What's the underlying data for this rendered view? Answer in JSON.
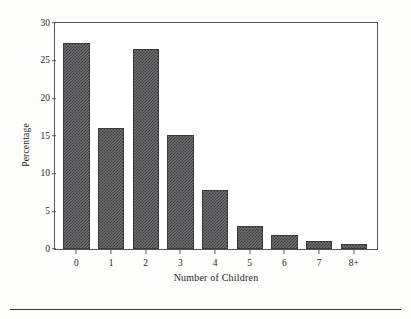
{
  "chart_data": {
    "type": "bar",
    "title": "",
    "xlabel": "Number of Children",
    "ylabel": "Percentage",
    "categories": [
      "0",
      "1",
      "2",
      "3",
      "4",
      "5",
      "6",
      "7",
      "8+"
    ],
    "values": [
      27.4,
      16.0,
      26.6,
      15.2,
      7.9,
      3.0,
      1.8,
      1.0,
      0.6
    ],
    "ylim": [
      0,
      30
    ],
    "yticks": [
      0,
      5,
      10,
      15,
      20,
      25,
      30
    ],
    "ytick_labels": [
      "0",
      "5",
      "10",
      "15",
      "20",
      "25",
      "30"
    ],
    "grid": false,
    "legend": null,
    "bar_fill": "#6d6d70",
    "bar_edge": "#3a3a3c",
    "axis_color": "#55565a",
    "text_color": "#1d1d1d",
    "background": "#ffffff"
  },
  "figure": {
    "footer_rule_color": "#2e2e30"
  }
}
